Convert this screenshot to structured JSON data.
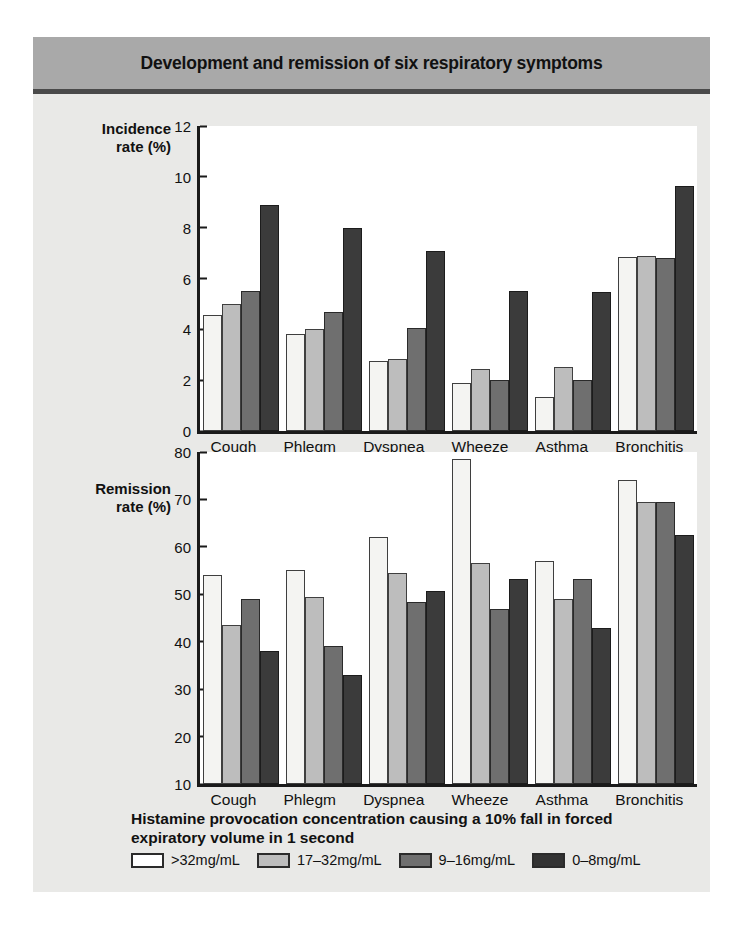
{
  "header": {
    "title": "Development and remission of six respiratory symptoms"
  },
  "caption": "Histamine provocation concentration causing a 10% fall in forced expiratory volume in 1 second",
  "legend": {
    "items": [
      {
        "label": ">32mg/mL",
        "color": "#ffffff"
      },
      {
        "label": "17–32mg/mL",
        "color": "#bdbdbd"
      },
      {
        "label": "9–16mg/mL",
        "color": "#6f6f6f"
      },
      {
        "label": "0–8mg/mL",
        "color": "#333333"
      }
    ]
  },
  "chart_data": [
    {
      "type": "bar",
      "title": "",
      "ylabel": "Incidence\nrate (%)",
      "xlabel": "Histamine provocation concentration causing a 10% fall in forced expiratory volume in 1 second",
      "ylim": [
        0,
        12
      ],
      "yticks": [
        12,
        10,
        8,
        6,
        4,
        2,
        0
      ],
      "grid": false,
      "legend_position": "bottom",
      "categories": [
        "Cough",
        "Phlegm",
        "Dyspnea",
        "Wheeze",
        "Asthma",
        "Bronchitis"
      ],
      "series": [
        {
          "name": ">32mg/mL",
          "color": "#f4f4f2",
          "values": [
            4.55,
            3.8,
            2.75,
            1.9,
            1.35,
            6.85
          ]
        },
        {
          "name": "17–32mg/mL",
          "color": "#bdbdbd",
          "values": [
            5.0,
            4.0,
            2.85,
            2.45,
            2.5,
            6.9
          ]
        },
        {
          "name": "9–16mg/mL",
          "color": "#6f6f6f",
          "values": [
            5.5,
            4.7,
            4.05,
            2.0,
            2.0,
            6.8
          ]
        },
        {
          "name": "0–8mg/mL",
          "color": "#3b3b3b",
          "values": [
            8.9,
            8.0,
            7.1,
            5.5,
            5.45,
            9.65
          ]
        }
      ]
    },
    {
      "type": "bar",
      "title": "",
      "ylabel": "Remission\nrate (%)",
      "xlabel": "Histamine provocation concentration causing a 10% fall in forced expiratory volume in 1 second",
      "ylim": [
        10,
        80
      ],
      "yticks": [
        80,
        70,
        60,
        50,
        40,
        30,
        20,
        10
      ],
      "grid": false,
      "legend_position": "bottom",
      "categories": [
        "Cough",
        "Phlegm",
        "Dyspnea",
        "Wheeze",
        "Asthma",
        "Bronchitis"
      ],
      "series": [
        {
          "name": ">32mg/mL",
          "color": "#f4f4f2",
          "values": [
            54.0,
            55.2,
            62.0,
            78.6,
            57.0,
            74.0
          ]
        },
        {
          "name": "17–32mg/mL",
          "color": "#bdbdbd",
          "values": [
            43.5,
            49.5,
            54.5,
            56.5,
            49.0,
            69.5
          ]
        },
        {
          "name": "9–16mg/mL",
          "color": "#6f6f6f",
          "values": [
            49.0,
            39.0,
            48.3,
            47.0,
            53.2,
            69.5
          ]
        },
        {
          "name": "0–8mg/mL",
          "color": "#3b3b3b",
          "values": [
            38.0,
            33.0,
            50.7,
            53.2,
            43.0,
            62.5
          ]
        }
      ]
    }
  ]
}
